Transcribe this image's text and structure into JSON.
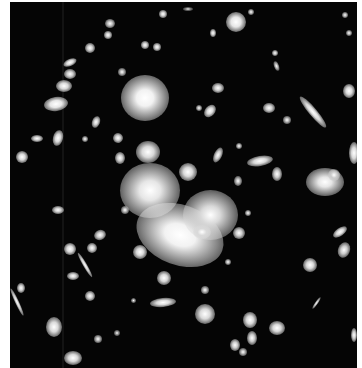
{
  "image": {
    "description": "Deep-field astronomical photograph of a galaxy cluster with bright central halo and gravitationally lensed arcs",
    "background": "#050505",
    "frame": {
      "left": 10,
      "top": 2,
      "width": 347,
      "height": 366
    }
  },
  "objects": [
    {
      "x": 145,
      "y": 98,
      "w": 48,
      "h": 46,
      "rot": 0,
      "b": 0.95,
      "glow": 1
    },
    {
      "x": 180,
      "y": 235,
      "w": 90,
      "h": 60,
      "rot": 20,
      "b": 0.95,
      "glow": 1
    },
    {
      "x": 150,
      "y": 190,
      "w": 60,
      "h": 55,
      "rot": 0,
      "b": 0.9,
      "glow": 1
    },
    {
      "x": 210,
      "y": 215,
      "w": 55,
      "h": 50,
      "rot": 0,
      "b": 0.85,
      "glow": 1
    },
    {
      "x": 325,
      "y": 182,
      "w": 38,
      "h": 28,
      "rot": 0,
      "b": 0.9,
      "glow": 1
    },
    {
      "x": 148,
      "y": 152,
      "w": 24,
      "h": 22,
      "rot": 0,
      "b": 0.85,
      "glow": 0
    },
    {
      "x": 188,
      "y": 172,
      "w": 18,
      "h": 18,
      "rot": 0,
      "b": 0.85,
      "glow": 0
    },
    {
      "x": 236,
      "y": 22,
      "w": 20,
      "h": 20,
      "rot": 0,
      "b": 0.9,
      "glow": 0
    },
    {
      "x": 56,
      "y": 104,
      "w": 24,
      "h": 14,
      "rot": -8,
      "b": 0.9,
      "glow": 0
    },
    {
      "x": 64,
      "y": 86,
      "w": 16,
      "h": 12,
      "rot": 0,
      "b": 0.85,
      "glow": 0
    },
    {
      "x": 70,
      "y": 62,
      "w": 14,
      "h": 7,
      "rot": -25,
      "b": 0.85,
      "glow": 0
    },
    {
      "x": 70,
      "y": 74,
      "w": 12,
      "h": 10,
      "rot": 0,
      "b": 0.8,
      "glow": 0
    },
    {
      "x": 90,
      "y": 48,
      "w": 10,
      "h": 10,
      "rot": 0,
      "b": 0.8,
      "glow": 0
    },
    {
      "x": 108,
      "y": 35,
      "w": 8,
      "h": 8,
      "rot": 0,
      "b": 0.8,
      "glow": 0
    },
    {
      "x": 110,
      "y": 23,
      "w": 10,
      "h": 9,
      "rot": 0,
      "b": 0.75,
      "glow": 0
    },
    {
      "x": 163,
      "y": 14,
      "w": 8,
      "h": 8,
      "rot": 0,
      "b": 0.8,
      "glow": 0
    },
    {
      "x": 145,
      "y": 45,
      "w": 8,
      "h": 8,
      "rot": 0,
      "b": 0.8,
      "glow": 0
    },
    {
      "x": 157,
      "y": 47,
      "w": 8,
      "h": 8,
      "rot": 0,
      "b": 0.8,
      "glow": 0
    },
    {
      "x": 122,
      "y": 72,
      "w": 8,
      "h": 8,
      "rot": 0,
      "b": 0.7,
      "glow": 0
    },
    {
      "x": 96,
      "y": 122,
      "w": 8,
      "h": 12,
      "rot": 20,
      "b": 0.8,
      "glow": 0
    },
    {
      "x": 58,
      "y": 138,
      "w": 10,
      "h": 16,
      "rot": 15,
      "b": 0.85,
      "glow": 0
    },
    {
      "x": 37,
      "y": 138,
      "w": 12,
      "h": 7,
      "rot": 0,
      "b": 0.8,
      "glow": 0
    },
    {
      "x": 22,
      "y": 157,
      "w": 12,
      "h": 12,
      "rot": 0,
      "b": 0.85,
      "glow": 0
    },
    {
      "x": 85,
      "y": 139,
      "w": 6,
      "h": 6,
      "rot": 0,
      "b": 0.7,
      "glow": 0
    },
    {
      "x": 118,
      "y": 138,
      "w": 10,
      "h": 10,
      "rot": -20,
      "b": 0.8,
      "glow": 0
    },
    {
      "x": 120,
      "y": 158,
      "w": 10,
      "h": 12,
      "rot": 0,
      "b": 0.8,
      "glow": 0
    },
    {
      "x": 213,
      "y": 33,
      "w": 6,
      "h": 8,
      "rot": 0,
      "b": 0.8,
      "glow": 0
    },
    {
      "x": 251,
      "y": 12,
      "w": 6,
      "h": 6,
      "rot": 0,
      "b": 0.7,
      "glow": 0
    },
    {
      "x": 275,
      "y": 53,
      "w": 6,
      "h": 6,
      "rot": 0,
      "b": 0.75,
      "glow": 0
    },
    {
      "x": 276,
      "y": 66,
      "w": 5,
      "h": 10,
      "rot": -20,
      "b": 0.7,
      "glow": 0
    },
    {
      "x": 218,
      "y": 88,
      "w": 12,
      "h": 10,
      "rot": 0,
      "b": 0.8,
      "glow": 0
    },
    {
      "x": 210,
      "y": 111,
      "w": 10,
      "h": 14,
      "rot": 40,
      "b": 0.85,
      "glow": 0
    },
    {
      "x": 269,
      "y": 108,
      "w": 12,
      "h": 10,
      "rot": 0,
      "b": 0.8,
      "glow": 0
    },
    {
      "x": 287,
      "y": 120,
      "w": 8,
      "h": 8,
      "rot": 0,
      "b": 0.7,
      "glow": 0
    },
    {
      "x": 313,
      "y": 112,
      "w": 8,
      "h": 40,
      "rot": -40,
      "b": 0.85,
      "glow": 0
    },
    {
      "x": 349,
      "y": 91,
      "w": 12,
      "h": 14,
      "rot": 0,
      "b": 0.85,
      "glow": 0
    },
    {
      "x": 218,
      "y": 155,
      "w": 8,
      "h": 16,
      "rot": 25,
      "b": 0.8,
      "glow": 0
    },
    {
      "x": 260,
      "y": 161,
      "w": 26,
      "h": 10,
      "rot": -10,
      "b": 0.85,
      "glow": 0
    },
    {
      "x": 277,
      "y": 174,
      "w": 10,
      "h": 14,
      "rot": 0,
      "b": 0.8,
      "glow": 0
    },
    {
      "x": 188,
      "y": 9,
      "w": 10,
      "h": 4,
      "rot": 0,
      "b": 0.5,
      "glow": 0
    },
    {
      "x": 345,
      "y": 15,
      "w": 6,
      "h": 6,
      "rot": 0,
      "b": 0.7,
      "glow": 0
    },
    {
      "x": 349,
      "y": 33,
      "w": 6,
      "h": 6,
      "rot": 0,
      "b": 0.7,
      "glow": 0
    },
    {
      "x": 239,
      "y": 146,
      "w": 6,
      "h": 6,
      "rot": 0,
      "b": 0.7,
      "glow": 0
    },
    {
      "x": 199,
      "y": 108,
      "w": 6,
      "h": 6,
      "rot": 0,
      "b": 0.7,
      "glow": 0
    },
    {
      "x": 58,
      "y": 210,
      "w": 12,
      "h": 8,
      "rot": 0,
      "b": 0.8,
      "glow": 0
    },
    {
      "x": 100,
      "y": 235,
      "w": 12,
      "h": 10,
      "rot": -20,
      "b": 0.8,
      "glow": 0
    },
    {
      "x": 70,
      "y": 249,
      "w": 12,
      "h": 12,
      "rot": 0,
      "b": 0.85,
      "glow": 0
    },
    {
      "x": 92,
      "y": 248,
      "w": 10,
      "h": 10,
      "rot": 0,
      "b": 0.8,
      "glow": 0
    },
    {
      "x": 85,
      "y": 265,
      "w": 4,
      "h": 28,
      "rot": -30,
      "b": 0.8,
      "glow": 0
    },
    {
      "x": 73,
      "y": 276,
      "w": 12,
      "h": 8,
      "rot": 0,
      "b": 0.8,
      "glow": 0
    },
    {
      "x": 90,
      "y": 296,
      "w": 10,
      "h": 10,
      "rot": 0,
      "b": 0.8,
      "glow": 0
    },
    {
      "x": 21,
      "y": 288,
      "w": 8,
      "h": 10,
      "rot": 0,
      "b": 0.8,
      "glow": 0
    },
    {
      "x": 17,
      "y": 302,
      "w": 4,
      "h": 30,
      "rot": -25,
      "b": 0.8,
      "glow": 0
    },
    {
      "x": 54,
      "y": 327,
      "w": 16,
      "h": 20,
      "rot": 0,
      "b": 0.85,
      "glow": 0
    },
    {
      "x": 73,
      "y": 358,
      "w": 18,
      "h": 14,
      "rot": 0,
      "b": 0.85,
      "glow": 0
    },
    {
      "x": 98,
      "y": 339,
      "w": 8,
      "h": 8,
      "rot": 0,
      "b": 0.7,
      "glow": 0
    },
    {
      "x": 163,
      "y": 302,
      "w": 26,
      "h": 9,
      "rot": -5,
      "b": 0.85,
      "glow": 0
    },
    {
      "x": 164,
      "y": 278,
      "w": 14,
      "h": 14,
      "rot": 0,
      "b": 0.85,
      "glow": 0
    },
    {
      "x": 202,
      "y": 232,
      "w": 18,
      "h": 14,
      "rot": 0,
      "b": 0.85,
      "glow": 0
    },
    {
      "x": 239,
      "y": 233,
      "w": 12,
      "h": 12,
      "rot": 0,
      "b": 0.8,
      "glow": 0
    },
    {
      "x": 248,
      "y": 213,
      "w": 6,
      "h": 6,
      "rot": 0,
      "b": 0.7,
      "glow": 0
    },
    {
      "x": 310,
      "y": 265,
      "w": 14,
      "h": 14,
      "rot": 0,
      "b": 0.85,
      "glow": 0
    },
    {
      "x": 340,
      "y": 232,
      "w": 16,
      "h": 8,
      "rot": -35,
      "b": 0.85,
      "glow": 0
    },
    {
      "x": 344,
      "y": 250,
      "w": 12,
      "h": 16,
      "rot": 20,
      "b": 0.8,
      "glow": 0
    },
    {
      "x": 316,
      "y": 303,
      "w": 3,
      "h": 14,
      "rot": 35,
      "b": 0.7,
      "glow": 0
    },
    {
      "x": 205,
      "y": 314,
      "w": 20,
      "h": 20,
      "rot": 0,
      "b": 0.85,
      "glow": 0
    },
    {
      "x": 250,
      "y": 320,
      "w": 14,
      "h": 16,
      "rot": 0,
      "b": 0.85,
      "glow": 0
    },
    {
      "x": 277,
      "y": 328,
      "w": 16,
      "h": 14,
      "rot": 0,
      "b": 0.85,
      "glow": 0
    },
    {
      "x": 252,
      "y": 338,
      "w": 10,
      "h": 14,
      "rot": 0,
      "b": 0.8,
      "glow": 0
    },
    {
      "x": 235,
      "y": 345,
      "w": 10,
      "h": 12,
      "rot": 0,
      "b": 0.8,
      "glow": 0
    },
    {
      "x": 243,
      "y": 352,
      "w": 8,
      "h": 8,
      "rot": 0,
      "b": 0.7,
      "glow": 0
    },
    {
      "x": 205,
      "y": 290,
      "w": 8,
      "h": 8,
      "rot": 0,
      "b": 0.7,
      "glow": 0
    },
    {
      "x": 238,
      "y": 181,
      "w": 8,
      "h": 10,
      "rot": 0,
      "b": 0.7,
      "glow": 0
    },
    {
      "x": 228,
      "y": 262,
      "w": 6,
      "h": 6,
      "rot": 0,
      "b": 0.7,
      "glow": 0
    },
    {
      "x": 125,
      "y": 210,
      "w": 8,
      "h": 8,
      "rot": 0,
      "b": 0.7,
      "glow": 0
    },
    {
      "x": 140,
      "y": 252,
      "w": 14,
      "h": 14,
      "rot": 0,
      "b": 0.85,
      "glow": 0
    },
    {
      "x": 133,
      "y": 300,
      "w": 5,
      "h": 5,
      "rot": 0,
      "b": 0.6,
      "glow": 0
    },
    {
      "x": 354,
      "y": 153,
      "w": 10,
      "h": 22,
      "rot": 0,
      "b": 0.85,
      "glow": 0
    },
    {
      "x": 334,
      "y": 175,
      "w": 12,
      "h": 12,
      "rot": 0,
      "b": 0.8,
      "glow": 0
    },
    {
      "x": 117,
      "y": 333,
      "w": 6,
      "h": 6,
      "rot": 0,
      "b": 0.6,
      "glow": 0
    },
    {
      "x": 354,
      "y": 335,
      "w": 6,
      "h": 14,
      "rot": 0,
      "b": 0.8,
      "glow": 0
    }
  ]
}
